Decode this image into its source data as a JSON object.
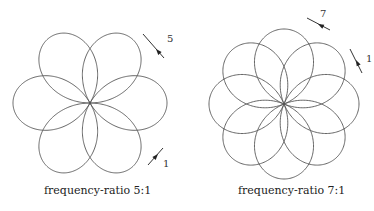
{
  "figures": [
    {
      "caption": "frequency-ratio 5:1",
      "ratio": 5,
      "center": [
        90,
        103
      ],
      "radius": 38.5,
      "arrows": [
        {
          "label": "5",
          "from": [
            143,
            34
          ],
          "to": [
            164,
            58
          ],
          "head": [
            156,
            49
          ],
          "dir": "up-left",
          "label_pos": [
            167,
            42
          ]
        },
        {
          "label": "1",
          "from": [
            148,
            165
          ],
          "to": [
            163,
            148
          ],
          "head": [
            158,
            154
          ],
          "dir": "down-left",
          "label_pos": [
            163,
            167
          ]
        }
      ]
    },
    {
      "caption": "frequency-ratio 7:1",
      "ratio": 7,
      "center": [
        284,
        104
      ],
      "radius": 37.5,
      "arrows": [
        {
          "label": "7",
          "from": [
            307,
            18
          ],
          "to": [
            330,
            30
          ],
          "head": [
            318,
            24
          ],
          "dir": "left",
          "label_pos": [
            320,
            17
          ]
        },
        {
          "label": "1",
          "from": [
            350,
            49
          ],
          "to": [
            362,
            73
          ],
          "head": [
            356,
            60
          ],
          "dir": "up",
          "label_pos": [
            366,
            62
          ]
        }
      ]
    }
  ],
  "stroke_color": "#555555"
}
